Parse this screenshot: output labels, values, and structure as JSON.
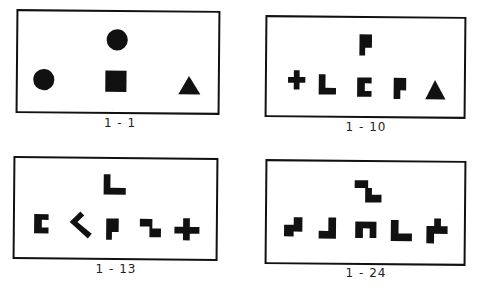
{
  "figure": {
    "panels": [
      {
        "id": "p1",
        "caption": "1 - 1",
        "box": {
          "x": 16,
          "y": 10,
          "w": 204,
          "h": 104,
          "rotate": 0.5
        },
        "caption_pos": {
          "x": 80,
          "y": 116
        },
        "target": {
          "type": "circle",
          "cx": 101,
          "cy": 29,
          "r": 11
        },
        "choices": [
          {
            "type": "circle",
            "cx": 25,
            "cy": 71,
            "r": 11
          },
          {
            "type": "square",
            "x": 89,
            "y": 61,
            "w": 22,
            "h": 22
          },
          {
            "type": "triangle",
            "points": "165,85 188,85 176,66"
          }
        ]
      },
      {
        "id": "p2",
        "caption": "1 - 10",
        "box": {
          "x": 265,
          "y": 16,
          "w": 201,
          "h": 102,
          "rotate": 0.5
        },
        "caption_pos": {
          "x": 326,
          "y": 120
        },
        "target": {
          "type": "poly",
          "points": "94,17 107,17 107,31 100,31 100,39 94,39"
        },
        "choices": [
          {
            "type": "poly",
            "points": "20,62 26,62 26,55 32,55 32,62 38,62 38,68 32,68 32,75 26,75 26,68 20,68"
          },
          {
            "type": "poly",
            "points": "52,59 59,59 59,73 70,73 70,80 52,80"
          },
          {
            "type": "poly",
            "points": "92,62 107,62 107,68 100,68 100,76 107,76 107,82 92,82"
          },
          {
            "type": "poly",
            "points": "130,62 143,62 143,75 137,75 137,84 130,84"
          },
          {
            "type": "triangle",
            "points": "163,84 184,84 173,64"
          }
        ]
      },
      {
        "id": "p3",
        "caption": "1 - 13",
        "box": {
          "x": 13,
          "y": 157,
          "w": 205,
          "h": 103,
          "rotate": 0.5
        },
        "caption_pos": {
          "x": 76,
          "y": 262
        },
        "target": {
          "type": "poly",
          "points": "90,16 97,16 97,30 113,30 113,37 90,37"
        },
        "choices": [
          {
            "type": "poly",
            "points": "18,58 33,58 33,64 26,64 26,72 33,72 33,78 18,78"
          },
          {
            "type": "poly",
            "points": "55,66 66,55 70,59 63,66 78,78 74,83"
          },
          {
            "type": "poly",
            "points": "93,62 106,62 106,76 99,76 99,84 93,84"
          },
          {
            "type": "poly",
            "points": "128,62 141,62 141,72 150,72 150,81 138,81 138,70 128,70"
          },
          {
            "type": "poly",
            "points": "164,70 173,70 173,61 180,61 180,70 190,70 190,77 180,77 180,84 173,84 173,77 164,77"
          }
        ]
      },
      {
        "id": "p4",
        "caption": "1 - 24",
        "box": {
          "x": 265,
          "y": 160,
          "w": 201,
          "h": 105,
          "rotate": 0.5
        },
        "caption_pos": {
          "x": 326,
          "y": 266
        },
        "target": {
          "type": "poly",
          "points": "89,19 103,19 103,27 107,27 107,34 117,34 117,42 100,42 100,27 89,27"
        },
        "choices": [
          {
            "type": "poly",
            "points": "16,66 26,66 26,58 35,58 35,73 26,73 26,78 16,78"
          },
          {
            "type": "poly",
            "points": "52,72 62,72 62,58 70,58 70,80 52,80"
          },
          {
            "type": "poly",
            "points": "90,62 112,62 112,79 105,79 105,69 98,69 98,79 90,79"
          },
          {
            "type": "poly",
            "points": "127,60 135,60 135,74 149,74 149,82 127,82"
          },
          {
            "type": "poly",
            "points": "164,66 172,66 172,58 179,58 179,66 186,66 186,74 172,74 172,84 164,84"
          }
        ]
      }
    ]
  }
}
